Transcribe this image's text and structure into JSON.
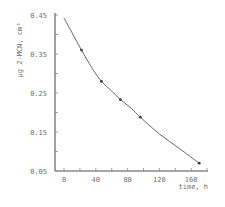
{
  "chart_data": {
    "type": "line",
    "title": "",
    "xlabel": "time, h",
    "ylabel": "μg 2-MCN, cm³",
    "xlim": [
      -5,
      180
    ],
    "ylim": [
      0.05,
      0.45
    ],
    "x_ticks": [
      0,
      40,
      80,
      120,
      160
    ],
    "x_tick_labels": [
      "0",
      "40",
      "80",
      "120",
      "160"
    ],
    "x_minor_step": 20,
    "y_ticks": [
      0.05,
      0.15,
      0.25,
      0.35,
      0.45
    ],
    "y_tick_labels": [
      "0.05",
      "0.15",
      "0.25",
      "0.35",
      "0.45"
    ],
    "y_minor_step": 0.05,
    "grid": false,
    "legend": null,
    "series": [
      {
        "name": "2-MCN concentration",
        "markers": true,
        "x": [
          22,
          47,
          71,
          96,
          170
        ],
        "y": [
          0.36,
          0.28,
          0.233,
          0.188,
          0.07
        ]
      },
      {
        "name": "fitted curve",
        "markers": false,
        "x": [
          0,
          10,
          22,
          35,
          47,
          60,
          71,
          85,
          96,
          120,
          145,
          170
        ],
        "y": [
          0.442,
          0.405,
          0.36,
          0.315,
          0.28,
          0.255,
          0.233,
          0.21,
          0.188,
          0.145,
          0.108,
          0.07
        ]
      }
    ],
    "colors": {
      "axis": "#8a8a8a",
      "line": "#555555",
      "marker": "#333333",
      "text": "#6f6f6f"
    }
  }
}
